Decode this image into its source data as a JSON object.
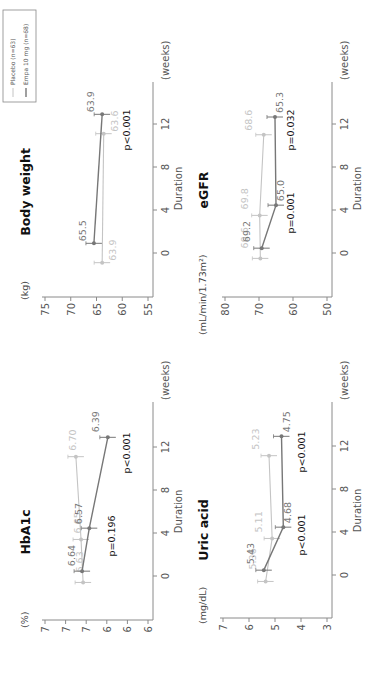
{
  "orientation": "rotated -90deg (text reads bottom-to-top)",
  "legend": {
    "items": [
      {
        "label": "Placebo (n=63)",
        "color": "#c4c4c4"
      },
      {
        "label": "Empa  10 mg (n=68)",
        "color": "#777777"
      }
    ]
  },
  "colors": {
    "placebo": "#c4c4c4",
    "empa": "#777777",
    "axis": "#8a8a8a"
  },
  "chart_data": [
    {
      "type": "line",
      "title": "Body weight",
      "ylabel": "(kg)",
      "xlabel": "Duration",
      "xunit": "(weeks)",
      "x_ticks": [
        0,
        4,
        8,
        12
      ],
      "y_ticks": [
        75,
        70,
        65,
        60,
        55
      ],
      "ylim": [
        55,
        75
      ],
      "series": [
        {
          "name": "Placebo (n=63)",
          "x": [
            0,
            12
          ],
          "values": [
            63.9,
            63.6
          ]
        },
        {
          "name": "Empa 10 mg (n=68)",
          "x": [
            0,
            12
          ],
          "values": [
            65.5,
            63.9
          ]
        }
      ],
      "annotations": [
        {
          "x": 12,
          "text": "p<0.001"
        }
      ]
    },
    {
      "type": "line",
      "title": "HbA1c",
      "ylabel": "(%)",
      "xlabel": "Duration",
      "xunit": "(weeks)",
      "x_ticks": [
        0,
        4,
        8,
        12
      ],
      "y_ticks": [
        7.0,
        6.8,
        6.6,
        6.4,
        6.2,
        6.0
      ],
      "ylim": [
        6.0,
        7.0
      ],
      "series": [
        {
          "name": "Placebo (n=63)",
          "x": [
            0,
            4,
            12
          ],
          "values": [
            6.63,
            6.65,
            6.7
          ]
        },
        {
          "name": "Empa 10 mg (n=68)",
          "x": [
            0,
            4,
            12
          ],
          "values": [
            6.64,
            6.57,
            6.39
          ]
        }
      ],
      "annotations": [
        {
          "x": 4,
          "text": "p=0.196"
        },
        {
          "x": 12,
          "text": "p<0.001"
        }
      ]
    },
    {
      "type": "line",
      "title": "eGFR",
      "ylabel": "(mL/min/1.73m²)",
      "xlabel": "Duration",
      "xunit": "(weeks)",
      "x_ticks": [
        0,
        4,
        8,
        12
      ],
      "y_ticks": [
        80,
        70,
        60,
        50
      ],
      "ylim": [
        50,
        80
      ],
      "series": [
        {
          "name": "Placebo (n=63)",
          "x": [
            0,
            4,
            12
          ],
          "values": [
            69.6,
            69.8,
            68.6
          ]
        },
        {
          "name": "Empa 10 mg (n=68)",
          "x": [
            0,
            4,
            12
          ],
          "values": [
            69.2,
            65.0,
            65.3
          ]
        }
      ],
      "annotations": [
        {
          "x": 4,
          "text": "p=0.001"
        },
        {
          "x": 12,
          "text": "p=0.032"
        }
      ]
    },
    {
      "type": "line",
      "title": "Uric acid",
      "ylabel": "(mg/dL)",
      "xlabel": "Duration",
      "xunit": "(weeks)",
      "x_ticks": [
        0,
        4,
        8,
        12
      ],
      "y_ticks": [
        7,
        6,
        5,
        4,
        3
      ],
      "ylim": [
        3,
        7
      ],
      "series": [
        {
          "name": "Placebo (n=63)",
          "x": [
            0,
            4,
            12
          ],
          "values": [
            5.36,
            5.11,
            5.23
          ]
        },
        {
          "name": "Empa 10 mg (n=68)",
          "x": [
            0,
            4,
            12
          ],
          "values": [
            5.43,
            4.68,
            4.75
          ]
        }
      ],
      "annotations": [
        {
          "x": 4,
          "text": "p<0.001"
        },
        {
          "x": 12,
          "text": "p<0.001"
        }
      ]
    }
  ]
}
